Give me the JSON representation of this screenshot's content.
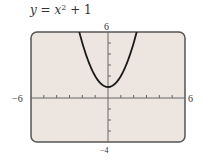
{
  "title": {
    "y": "y",
    "eq": " = ",
    "x": "x",
    "exp": "2",
    "rest": " + 1"
  },
  "axes": {
    "xmin_label": "−6",
    "xmax_label": "6",
    "ymax_label": "6",
    "ymin_label": "−4"
  },
  "colors": {
    "plot_bg": "#ede6e0",
    "frame": "#555555",
    "axis": "#666666",
    "curve": "#1a1a1a"
  },
  "chart_data": {
    "type": "line",
    "xlabel": "",
    "ylabel": "",
    "xlim": [
      -6,
      6
    ],
    "ylim": [
      -4,
      6
    ],
    "grid": false,
    "legend": null,
    "xticks": [
      -6,
      -5,
      -4,
      -3,
      -2,
      -1,
      0,
      1,
      2,
      3,
      4,
      5,
      6
    ],
    "yticks": [
      -4,
      -3,
      -2,
      -1,
      0,
      1,
      2,
      3,
      4,
      5,
      6
    ],
    "tick_labels": {
      "x": [
        "-6",
        "6"
      ],
      "y": [
        "-4",
        "6"
      ]
    },
    "series": [
      {
        "name": "y = x^2 + 1",
        "x": [
          -2.236,
          -2,
          -1.75,
          -1.5,
          -1.25,
          -1,
          -0.75,
          -0.5,
          -0.25,
          0,
          0.25,
          0.5,
          0.75,
          1,
          1.25,
          1.5,
          1.75,
          2,
          2.236
        ],
        "y": [
          6,
          5,
          4.0625,
          3.25,
          2.5625,
          2,
          1.5625,
          1.25,
          1.0625,
          1,
          1.0625,
          1.25,
          1.5625,
          2,
          2.5625,
          3.25,
          4.0625,
          5,
          6
        ]
      }
    ]
  }
}
